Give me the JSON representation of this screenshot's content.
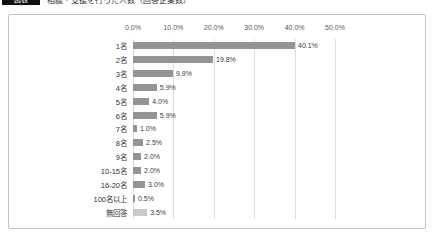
{
  "header": {
    "badge_label": "図表",
    "title": "相談・支援を行った人数（回答企業数）"
  },
  "chart_data": {
    "type": "bar",
    "orientation": "horizontal",
    "title": "",
    "xlabel": "",
    "ylabel": "",
    "xlim": [
      0,
      50
    ],
    "x_ticks": [
      "0.0%",
      "10.0%",
      "20.0%",
      "30.0%",
      "40.0%",
      "50.0%"
    ],
    "grid": "vertical",
    "legend": "none",
    "categories": [
      "1名",
      "2名",
      "3名",
      "4名",
      "5名",
      "6名",
      "7名",
      "8名",
      "9名",
      "10-15名",
      "16-20名",
      "100名以上",
      "無回答"
    ],
    "values": [
      40.1,
      19.8,
      9.9,
      5.9,
      4.0,
      5.9,
      1.0,
      2.5,
      2.0,
      2.0,
      3.0,
      0.5,
      3.5
    ],
    "value_labels": [
      "40.1%",
      "19.8%",
      "9.9%",
      "5.9%",
      "4.0%",
      "5.9%",
      "1.0%",
      "2.5%",
      "2.0%",
      "2.0%",
      "3.0%",
      "0.5%",
      "3.5%"
    ],
    "bar_color": "#949494",
    "muted_bar_color": "#c9c9c9",
    "muted_category": "無回答",
    "gridline_color": "#dcdcdc",
    "axis_text_color": "#595959"
  }
}
